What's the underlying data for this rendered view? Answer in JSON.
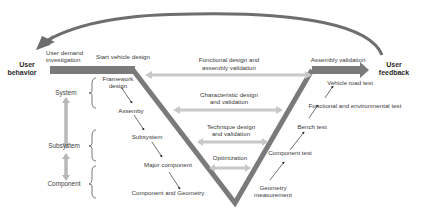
{
  "colors": {
    "v_stroke": "#7a7a7a",
    "feedback_arrow": "#6e6e6e",
    "double_arrow": "#c8c8c8",
    "level_arrow": "#b8b8b8",
    "text": "#3a3a3a",
    "pointer": "#333333"
  },
  "endpoints": {
    "left": {
      "line1": "User",
      "line2": "behavior"
    },
    "right": {
      "line1": "User",
      "line2": "feedback"
    }
  },
  "left_top": {
    "user_demand": {
      "line1": "User demand",
      "line2": "investigation"
    },
    "start_design": "Start vehicle design"
  },
  "right_top": {
    "assembly_validation": "Assembly validation"
  },
  "levels": [
    {
      "label": "System"
    },
    {
      "label": "Subsystem"
    },
    {
      "label": "Component"
    }
  ],
  "left_branch": [
    {
      "line1": "Framework",
      "line2": "design"
    },
    {
      "line1": "Assemby"
    },
    {
      "line1": "Subsystem"
    },
    {
      "line1": "Major component"
    },
    {
      "line1": "Component and Geometry"
    }
  ],
  "right_branch": [
    {
      "line1": "Vehicle road test"
    },
    {
      "line1": "Functional and environmental test"
    },
    {
      "line1": "Bench test"
    },
    {
      "line1": "Component test"
    },
    {
      "line1": "Geometry",
      "line2": "measurement"
    }
  ],
  "center_links": [
    {
      "line1": "Functional design and",
      "line2": "assembly validation"
    },
    {
      "line1": "Characteristic design",
      "line2": "and validation"
    },
    {
      "line1": "Technique design",
      "line2": "and validation"
    },
    {
      "line1": "Optimization"
    }
  ]
}
